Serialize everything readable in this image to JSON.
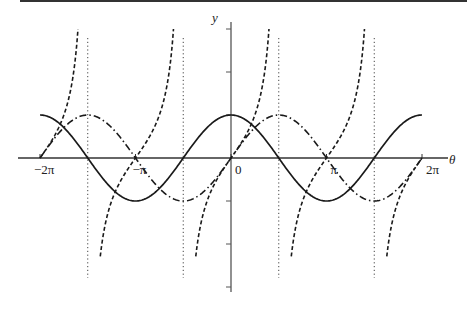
{
  "chart_data": {
    "type": "line",
    "title": "",
    "xlabel": "θ",
    "ylabel": "y",
    "xlim": [
      -6.2832,
      6.2832
    ],
    "ylim": [
      -3,
      3
    ],
    "x_ticks": [
      {
        "value": -6.2832,
        "label": "−2π"
      },
      {
        "value": -3.1416,
        "label": "−π"
      },
      {
        "value": 0,
        "label": "0"
      },
      {
        "value": 3.1416,
        "label": "π"
      },
      {
        "value": 6.2832,
        "label": "2π"
      }
    ],
    "y_ticks": [
      -3,
      -2,
      -1,
      1,
      2,
      3
    ],
    "grid": false,
    "legend": null,
    "series": [
      {
        "name": "cos θ",
        "style": "solid",
        "function": "cos",
        "x": [
          -6.2832,
          -4.7124,
          -3.1416,
          -1.5708,
          0,
          1.5708,
          3.1416,
          4.7124,
          6.2832
        ],
        "values": [
          1,
          0,
          -1,
          0,
          1,
          0,
          -1,
          0,
          1
        ]
      },
      {
        "name": "sin θ",
        "style": "dash-dot",
        "function": "sin",
        "x": [
          -6.2832,
          -4.7124,
          -3.1416,
          -1.5708,
          0,
          1.5708,
          3.1416,
          4.7124,
          6.2832
        ],
        "values": [
          0,
          1,
          0,
          -1,
          0,
          1,
          0,
          -1,
          0
        ]
      },
      {
        "name": "tan θ",
        "style": "dashed",
        "function": "tan",
        "x": [
          -6.2832,
          -3.1416,
          0,
          3.1416,
          6.2832
        ],
        "values": [
          0,
          0,
          0,
          0,
          0
        ]
      }
    ],
    "asymptotes": {
      "style": "dotted",
      "x": [
        -4.7124,
        -1.5708,
        1.5708,
        4.7124
      ]
    }
  },
  "axis": {
    "x_label": "θ",
    "y_label": "y",
    "tick_labels": [
      "−2π",
      "−π",
      "0",
      "π",
      "2π"
    ]
  }
}
